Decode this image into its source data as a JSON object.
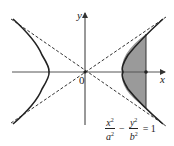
{
  "diagram": {
    "type": "hyperbola",
    "axes": {
      "x_label": "x",
      "y_label": "y",
      "origin_label": "0"
    },
    "equation": {
      "term1_num": "x",
      "term1_den": "a",
      "exp1": "2",
      "exp1d": "2",
      "minus": "−",
      "term2_num": "y",
      "term2_den": "b",
      "exp2": "2",
      "exp2d": "2",
      "equals": "= 1"
    },
    "colors": {
      "curve": "#222222",
      "shade": "#9a9a9a",
      "axis": "#555555",
      "asymptote": "#333333"
    },
    "features": [
      "two hyperbola branches",
      "dashed asymptotes",
      "shaded region between right vertex and vertical line",
      "point on x-axis"
    ]
  }
}
